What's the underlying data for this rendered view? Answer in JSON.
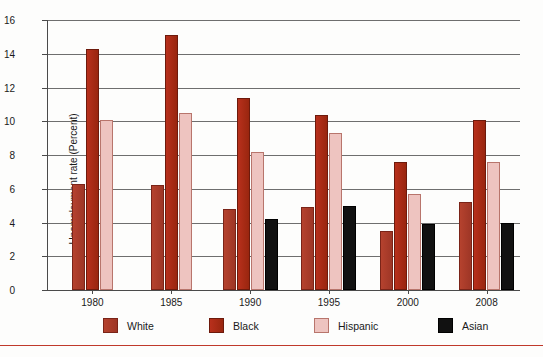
{
  "chart_data": {
    "type": "bar",
    "title": "",
    "xlabel": "",
    "ylabel": "Unemployment rate (Percent)",
    "ylim": [
      0,
      16
    ],
    "ytick_step": 2,
    "yticks": [
      0,
      2,
      4,
      6,
      8,
      10,
      12,
      14,
      16
    ],
    "ytick_labels": [
      "0",
      "2",
      "4",
      "6",
      "8",
      "10",
      "12",
      "14",
      "16"
    ],
    "categories": [
      "1980",
      "1985",
      "1990",
      "1995",
      "2000",
      "2008"
    ],
    "grid": "horizontal",
    "legend_position": "bottom",
    "series": [
      {
        "name": "White",
        "color": "#a93b28",
        "values": [
          6.3,
          6.2,
          4.8,
          4.9,
          3.5,
          5.2
        ]
      },
      {
        "name": "Black",
        "color": "#a82a15",
        "values": [
          14.3,
          15.1,
          11.4,
          10.4,
          7.6,
          10.1
        ]
      },
      {
        "name": "Hispanic",
        "color": "#eec4c0",
        "values": [
          10.1,
          10.5,
          8.2,
          9.3,
          5.7,
          7.6
        ]
      },
      {
        "name": "Asian",
        "color": "#111111",
        "values": [
          null,
          null,
          4.2,
          5.0,
          3.9,
          4.0
        ]
      }
    ]
  },
  "legend": {
    "items": [
      {
        "label": "White",
        "swatch": "white-s"
      },
      {
        "label": "Black",
        "swatch": "black-s"
      },
      {
        "label": "Hispanic",
        "swatch": "hispanic-s"
      },
      {
        "label": "Asian",
        "swatch": "asian-s"
      }
    ]
  }
}
